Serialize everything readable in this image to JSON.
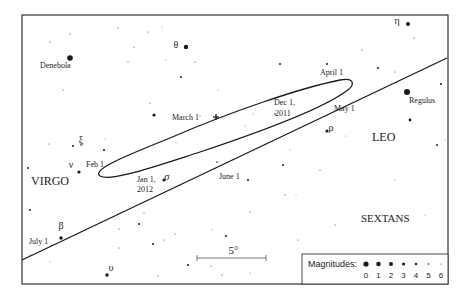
{
  "constellations": [
    {
      "name": "VIRGO",
      "x": 31,
      "y": 185,
      "size": 12
    },
    {
      "name": "LEO",
      "x": 372,
      "y": 141,
      "size": 12
    },
    {
      "name": "SEXTANS",
      "x": 361,
      "y": 222,
      "size": 11
    }
  ],
  "named_stars": [
    {
      "label": "Denebola",
      "x": 70,
      "y": 58,
      "r": 2.8,
      "lx": 40,
      "ly": 68
    },
    {
      "label": "Regulus",
      "x": 407,
      "y": 92,
      "r": 3,
      "lx": 409,
      "ly": 103
    },
    {
      "label": "θ",
      "x": 186,
      "y": 47,
      "r": 2.2,
      "lx": 176,
      "ly": 52
    },
    {
      "label": "η",
      "x": 408,
      "y": 24,
      "r": 2,
      "lx": 397,
      "ly": 28
    },
    {
      "label": "ρ",
      "x": 327,
      "y": 131,
      "r": 1.6,
      "lx": 331,
      "ly": 135
    },
    {
      "label": "σ",
      "x": 164,
      "y": 180,
      "r": 1.6,
      "lx": 167,
      "ly": 184
    },
    {
      "label": "ν",
      "x": 79,
      "y": 172,
      "r": 1.6,
      "lx": 71,
      "ly": 172
    },
    {
      "label": "ξ",
      "x": 81,
      "y": 145,
      "r": 0.8,
      "lx": 81,
      "ly": 147
    },
    {
      "label": "β",
      "x": 61,
      "y": 238,
      "r": 1.7,
      "lx": 61,
      "ly": 233
    },
    {
      "label": "υ",
      "x": 107,
      "y": 275,
      "r": 1.7,
      "lx": 111,
      "ly": 275
    }
  ],
  "date_labels": [
    {
      "text": "March 1",
      "x": 172,
      "y": 120
    },
    {
      "text": "April 1",
      "x": 320,
      "y": 75
    },
    {
      "text": "May 1",
      "x": 334,
      "y": 111
    },
    {
      "text": "Dec 1,",
      "x": 274,
      "y": 105
    },
    {
      "text": "2011",
      "x": 275,
      "y": 116
    },
    {
      "text": "Feb 1",
      "x": 86,
      "y": 167
    },
    {
      "text": "Jan 1,",
      "x": 137,
      "y": 182
    },
    {
      "text": "2012",
      "x": 137,
      "y": 192
    },
    {
      "text": "June 1",
      "x": 219,
      "y": 179
    },
    {
      "text": "July 1",
      "x": 29,
      "y": 244
    }
  ],
  "scale_bar": {
    "label": "5°",
    "x1": 197,
    "x2": 266,
    "y": 258
  },
  "legend": {
    "title": "Magnitudes:",
    "items": [
      {
        "mag": "0",
        "r": 2.6
      },
      {
        "mag": "1",
        "r": 2.3
      },
      {
        "mag": "2",
        "r": 2.0
      },
      {
        "mag": "3",
        "r": 1.6
      },
      {
        "mag": "4",
        "r": 1.2
      },
      {
        "mag": "5",
        "r": 0.8
      },
      {
        "mag": "6",
        "r": 0.5
      }
    ]
  },
  "field_stars": [
    [
      50,
      42,
      0.5
    ],
    [
      70,
      34,
      0.5
    ],
    [
      118,
      28,
      0.5
    ],
    [
      148,
      32,
      0.5
    ],
    [
      134,
      47,
      0.5
    ],
    [
      128,
      62,
      0.5
    ],
    [
      63,
      90,
      0.5
    ],
    [
      181,
      77,
      1
    ],
    [
      195,
      62,
      0.5
    ],
    [
      150,
      103,
      0.5
    ],
    [
      154,
      115,
      1.6
    ],
    [
      200,
      116,
      0.5
    ],
    [
      49,
      144,
      0.5
    ],
    [
      73,
      146,
      1
    ],
    [
      105,
      139,
      0.4
    ],
    [
      104,
      150,
      1
    ],
    [
      280,
      64,
      1
    ],
    [
      327,
      64,
      1
    ],
    [
      378,
      68,
      1
    ],
    [
      395,
      72,
      0.5
    ],
    [
      362,
      50,
      0.5
    ],
    [
      414,
      38,
      0.5
    ],
    [
      441,
      84,
      1
    ],
    [
      410,
      120,
      1.4
    ],
    [
      437,
      145,
      1
    ],
    [
      445,
      140,
      0.4
    ],
    [
      28,
      168,
      1
    ],
    [
      30,
      210,
      1
    ],
    [
      30,
      255,
      0.5
    ],
    [
      50,
      262,
      0.4
    ],
    [
      118,
      214,
      0.5
    ],
    [
      139,
      224,
      1
    ],
    [
      144,
      213,
      0.5
    ],
    [
      119,
      229,
      0.5
    ],
    [
      119,
      248,
      0.5
    ],
    [
      153,
      244,
      1
    ],
    [
      164,
      240,
      0.5
    ],
    [
      158,
      276,
      0.5
    ],
    [
      188,
      265,
      1
    ],
    [
      175,
      234,
      0.5
    ],
    [
      212,
      230,
      0.4
    ],
    [
      226,
      236,
      1
    ],
    [
      211,
      266,
      0.5
    ],
    [
      222,
      275,
      0.5
    ],
    [
      248,
      180,
      1
    ],
    [
      250,
      212,
      0.5
    ],
    [
      283,
      165,
      1
    ],
    [
      285,
      195,
      0.5
    ],
    [
      320,
      170,
      0.5
    ],
    [
      296,
      195,
      0.4
    ],
    [
      298,
      240,
      0.5
    ],
    [
      335,
      225,
      0.5
    ],
    [
      360,
      200,
      0.4
    ],
    [
      395,
      180,
      0.4
    ],
    [
      240,
      258,
      0.4
    ],
    [
      250,
      273,
      0.4
    ],
    [
      217,
      162,
      0.8
    ],
    [
      275,
      114,
      0.8
    ],
    [
      346,
      136,
      0.4
    ],
    [
      290,
      150,
      0.4
    ],
    [
      425,
      215,
      0.4
    ],
    [
      218,
      90,
      0.4
    ],
    [
      253,
      114,
      0.4
    ],
    [
      375,
      94,
      0.4
    ],
    [
      338,
      108,
      0.4
    ],
    [
      166,
      60,
      0.4
    ],
    [
      162,
      27,
      0.4
    ],
    [
      176,
      143,
      0.4
    ],
    [
      245,
      126,
      0.4
    ]
  ],
  "paths": {
    "ecliptic": "M 22 260 L 447 58",
    "mars_path": "M 60 246 C 150 200, 260 150, 310 100 C 330 80, 360 72, 345 85 C 320 110, 200 130, 120 160 C 100 170, 95 178, 115 178 C 180 168, 270 120, 345 86",
    "march_cross": {
      "x": 216,
      "y": 117
    }
  },
  "colors": {
    "ink": "#1a1a1a",
    "frame": "#333333",
    "background": "#ffffff"
  }
}
